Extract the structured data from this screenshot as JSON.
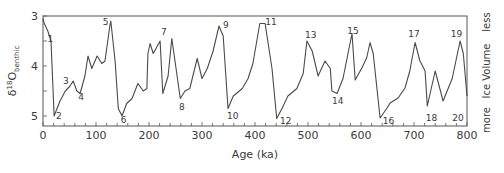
{
  "chart_data": {
    "type": "line",
    "title": "",
    "xlabel": "Age (ka)",
    "ylabel": "δ18O benthic",
    "ylabel_parts": {
      "delta": "δ",
      "superscript": "18",
      "main": "O",
      "subscript": "benthic"
    },
    "right_axis": {
      "label": "Ice Volume",
      "top": "less",
      "bottom": "more"
    },
    "xlim": [
      0,
      800
    ],
    "ylim": [
      5.2,
      3.0
    ],
    "y_inverted": true,
    "x_ticks": [
      0,
      100,
      200,
      300,
      400,
      500,
      600,
      700,
      800
    ],
    "x_minor_step": 20,
    "y_ticks": [
      3,
      4,
      5
    ],
    "y_minor_ticks": [
      3.5,
      4.5
    ],
    "grid": false,
    "legend": null,
    "line_color": "#4a4a4a",
    "series": [
      {
        "name": "benthic δ18O stack",
        "x": [
          0,
          2,
          9,
          15,
          19,
          21,
          32,
          42,
          51,
          57,
          64,
          70,
          79,
          85,
          92,
          102,
          111,
          117,
          126,
          128,
          136,
          142,
          149,
          158,
          168,
          179,
          189,
          196,
          198,
          202,
          208,
          221,
          226,
          236,
          243,
          253,
          259,
          268,
          277,
          291,
          300,
          310,
          321,
          332,
          340,
          349,
          359,
          376,
          387,
          396,
          409,
          419,
          432,
          441,
          451,
          462,
          479,
          491,
          498,
          508,
          519,
          532,
          542,
          545,
          555,
          566,
          583,
          589,
          602,
          611,
          617,
          623,
          636,
          649,
          655,
          670,
          683,
          692,
          702,
          711,
          721,
          725,
          740,
          755,
          772,
          787,
          793,
          800
        ],
        "y": [
          3.05,
          3.14,
          3.3,
          3.5,
          4.5,
          5.0,
          4.7,
          4.5,
          4.4,
          4.3,
          4.5,
          4.55,
          4.2,
          3.8,
          4.05,
          3.8,
          3.95,
          3.9,
          3.2,
          3.1,
          3.9,
          4.85,
          5.0,
          4.75,
          4.65,
          4.35,
          4.5,
          4.45,
          3.75,
          3.55,
          3.75,
          3.5,
          4.55,
          4.2,
          3.45,
          4.2,
          4.65,
          4.5,
          4.45,
          3.85,
          4.25,
          4.05,
          3.7,
          3.2,
          3.4,
          4.85,
          4.6,
          4.45,
          4.25,
          3.95,
          3.15,
          3.15,
          4.05,
          5.05,
          4.85,
          4.6,
          4.45,
          4.15,
          3.5,
          3.7,
          4.2,
          3.9,
          4.05,
          4.5,
          4.55,
          4.25,
          3.35,
          4.28,
          4.03,
          3.83,
          3.53,
          3.75,
          5.04,
          4.84,
          4.74,
          4.64,
          4.44,
          4.1,
          3.53,
          3.89,
          4.1,
          4.8,
          4.1,
          4.7,
          4.25,
          3.5,
          3.75,
          4.6
        ]
      }
    ],
    "annotations": [
      {
        "label": "1",
        "x": 14,
        "y": 3.45
      },
      {
        "label": "2",
        "x": 30,
        "y": 5.0
      },
      {
        "label": "3",
        "x": 43,
        "y": 4.3
      },
      {
        "label": "4",
        "x": 72,
        "y": 4.62
      },
      {
        "label": "5",
        "x": 118,
        "y": 3.12
      },
      {
        "label": "6",
        "x": 152,
        "y": 5.08
      },
      {
        "label": "7",
        "x": 228,
        "y": 3.32
      },
      {
        "label": "8",
        "x": 262,
        "y": 4.82
      },
      {
        "label": "9",
        "x": 345,
        "y": 3.18
      },
      {
        "label": "10",
        "x": 358,
        "y": 5.0
      },
      {
        "label": "11",
        "x": 430,
        "y": 3.12
      },
      {
        "label": "12",
        "x": 458,
        "y": 5.1
      },
      {
        "label": "13",
        "x": 505,
        "y": 3.38
      },
      {
        "label": "14",
        "x": 556,
        "y": 4.7
      },
      {
        "label": "15",
        "x": 585,
        "y": 3.3
      },
      {
        "label": "16",
        "x": 652,
        "y": 5.1
      },
      {
        "label": "17",
        "x": 700,
        "y": 3.35
      },
      {
        "label": "18",
        "x": 733,
        "y": 5.03
      },
      {
        "label": "19",
        "x": 780,
        "y": 3.35
      },
      {
        "label": "20",
        "x": 783,
        "y": 5.03
      }
    ]
  }
}
